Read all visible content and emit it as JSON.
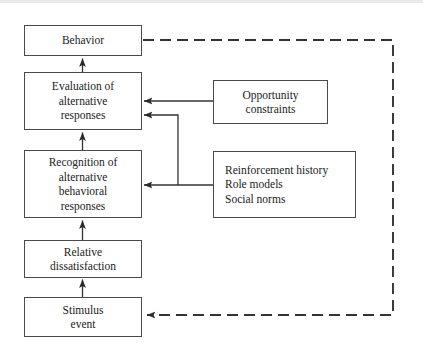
{
  "diagram": {
    "stroke_color": "#333333",
    "box_border_color": "#4a4a4a",
    "background": "#ffffff",
    "nodes": {
      "behavior": "Behavior",
      "evaluation": "Evaluation of\nalternative\nresponses",
      "recognition": "Recognition of\nalternative\nbehavioral\nresponses",
      "relative_dissatisfaction": "Relative\ndissatisfaction",
      "stimulus_event": "Stimulus\nevent",
      "opportunity_constraints": "Opportunity\nconstraints",
      "reinforcement_sources": "Reinforcement history\nRole models\nSocial norms"
    },
    "connectors": [
      {
        "name": "evaluation-to-behavior",
        "style": "solid",
        "direction": "up"
      },
      {
        "name": "recognition-to-evaluation",
        "style": "solid",
        "direction": "up"
      },
      {
        "name": "dissatisfaction-to-recognition",
        "style": "solid",
        "direction": "up"
      },
      {
        "name": "stimulus-to-dissatisfaction",
        "style": "solid",
        "direction": "up"
      },
      {
        "name": "opportunity-to-evaluation",
        "style": "solid",
        "direction": "left"
      },
      {
        "name": "reinforcement-to-evaluation",
        "style": "solid",
        "direction": "left"
      },
      {
        "name": "reinforcement-to-recognition",
        "style": "solid",
        "direction": "left"
      },
      {
        "name": "behavior-to-stimulus-feedback",
        "style": "dashed",
        "direction": "left"
      }
    ]
  }
}
